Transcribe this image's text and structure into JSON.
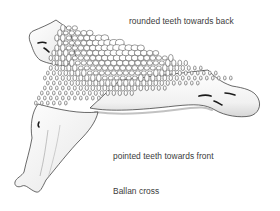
{
  "figure": {
    "labels": {
      "back": "rounded teeth towards back",
      "front": "pointed teeth towards front"
    },
    "caption": "Ballan cross"
  },
  "colors": {
    "ink": "#2b2b2b",
    "shade": "#bdbdbd",
    "paper": "#ffffff",
    "text": "#3b3b3b"
  }
}
